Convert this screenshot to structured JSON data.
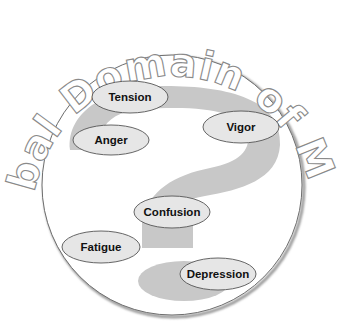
{
  "diagram": {
    "title": "Global Domain of Mood",
    "colors": {
      "background": "#ffffff",
      "circle_stroke": "#6e6e6e",
      "question_mark": "#c8c8c8",
      "ellipse_fill": "#e6e6e6",
      "ellipse_stroke": "#555555",
      "label_text": "#111111",
      "title_outline": "#8a8a8a"
    },
    "central_symbol": "question-mark",
    "moods": [
      {
        "label": "Tension",
        "cx": 130,
        "cy": 97,
        "rx": 38,
        "ry": 16
      },
      {
        "label": "Anger",
        "cx": 111,
        "cy": 140,
        "rx": 38,
        "ry": 15
      },
      {
        "label": "Vigor",
        "cx": 241,
        "cy": 127,
        "rx": 38,
        "ry": 16
      },
      {
        "label": "Confusion",
        "cx": 172,
        "cy": 212,
        "rx": 38,
        "ry": 16
      },
      {
        "label": "Fatigue",
        "cx": 101,
        "cy": 247,
        "rx": 39,
        "ry": 16
      },
      {
        "label": "Depression",
        "cx": 218,
        "cy": 274,
        "rx": 38,
        "ry": 16
      }
    ]
  }
}
